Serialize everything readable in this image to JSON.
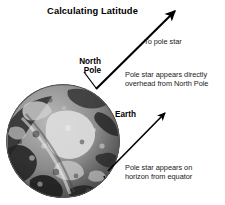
{
  "figure": {
    "title": "Calculating Latitude",
    "background_color": "#ffffff",
    "ink_color": "#000000"
  },
  "labels": {
    "north_pole": "North\nPole",
    "north_pole_line1": "North",
    "north_pole_line2": "Pole",
    "earth": "Earth"
  },
  "annotations": {
    "to_pole_star": "To pole star",
    "overhead_line1": "Pole star appears directly",
    "overhead_line2": "overhead from North Pole",
    "horizon_line1": "Pole star appears on",
    "horizon_line2": "horizon from equator"
  },
  "graphics": {
    "globe_name": "earth-globe-photo",
    "upper_arrow_name": "arrow-to-pole-star-from-north-pole",
    "lower_arrow_name": "arrow-to-pole-star-from-equator",
    "leader_name": "north-pole-leader-line"
  }
}
